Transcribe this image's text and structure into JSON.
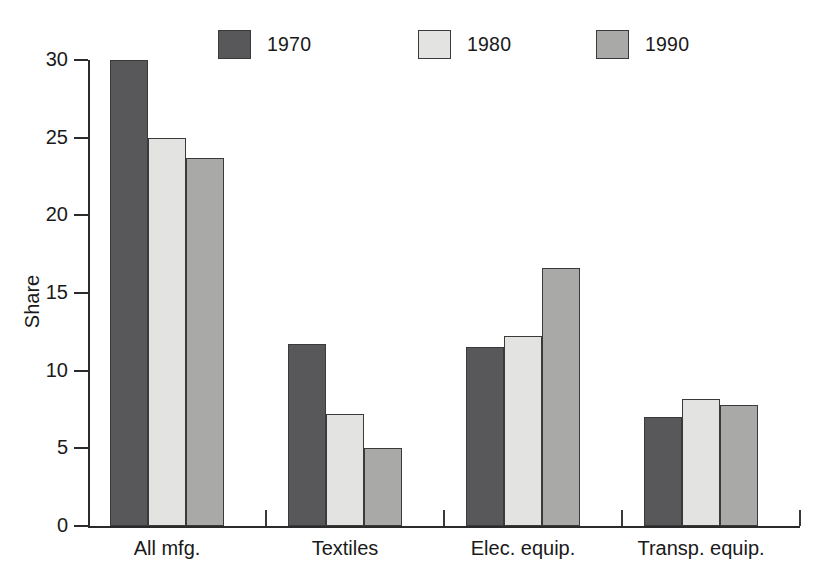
{
  "chart_data": {
    "type": "bar",
    "title": "",
    "xlabel": "",
    "ylabel": "Share",
    "categories": [
      "All mfg.",
      "Textiles",
      "Elec. equip.",
      "Transp. equip."
    ],
    "series": [
      {
        "name": "1970",
        "color": "#58585a",
        "values": [
          30.0,
          11.7,
          11.5,
          7.0
        ]
      },
      {
        "name": "1980",
        "color": "#e3e3e1",
        "values": [
          25.0,
          7.2,
          12.2,
          8.2
        ]
      },
      {
        "name": "1990",
        "color": "#a9a9a7",
        "values": [
          23.7,
          5.0,
          16.6,
          7.8
        ]
      }
    ],
    "ylim": [
      0,
      30
    ],
    "yticks": [
      0,
      5,
      10,
      15,
      20,
      25,
      30
    ],
    "ytick_labels": [
      "0",
      "5",
      "10",
      "15",
      "20",
      "25",
      "30"
    ],
    "grid": false,
    "legend_position": "top-center",
    "axis_color": "#2b2b2b",
    "bar_edge_color": "#3a3a3a",
    "background": "#ffffff"
  },
  "legend": {
    "items": [
      {
        "label": "1970",
        "color": "#58585a"
      },
      {
        "label": "1980",
        "color": "#e3e3e1"
      },
      {
        "label": "1990",
        "color": "#a9a9a7"
      }
    ]
  },
  "axes": {
    "y_label": "Share",
    "y_tick_labels": [
      "30",
      "25",
      "20",
      "15",
      "10",
      "5",
      "0"
    ],
    "x_tick_labels": [
      "All mfg.",
      "Textiles",
      "Elec. equip.",
      "Transp. equip."
    ]
  }
}
